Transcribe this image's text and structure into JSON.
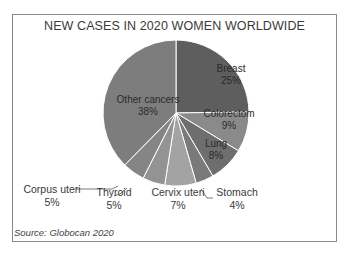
{
  "chart_data": {
    "type": "pie",
    "title": "NEW CASES IN 2020 WOMEN WORLDWIDE",
    "source": "Source: Globocan 2020",
    "start_angle": "12 o'clock, clockwise",
    "slices": [
      {
        "label": "Breast",
        "value": 25,
        "pct": "25%",
        "color": "#5e5e5e"
      },
      {
        "label": "Colorectom",
        "value": 9,
        "pct": "9%",
        "color": "#8a8a8a"
      },
      {
        "label": "Lung",
        "value": 8,
        "pct": "8%",
        "color": "#6e6e6e"
      },
      {
        "label": "Stomach",
        "value": 4,
        "pct": "4%",
        "color": "#7a7a7a"
      },
      {
        "label": "Cervix uteri",
        "value": 7,
        "pct": "7%",
        "color": "#a3a3a3"
      },
      {
        "label": "Thyroid",
        "value": 5,
        "pct": "5%",
        "color": "#939393"
      },
      {
        "label": "Corpus uteri",
        "value": 5,
        "pct": "5%",
        "color": "#858585"
      },
      {
        "label": "Other cancers",
        "value": 38,
        "pct": "38%",
        "color": "#7d7d7d"
      }
    ]
  }
}
